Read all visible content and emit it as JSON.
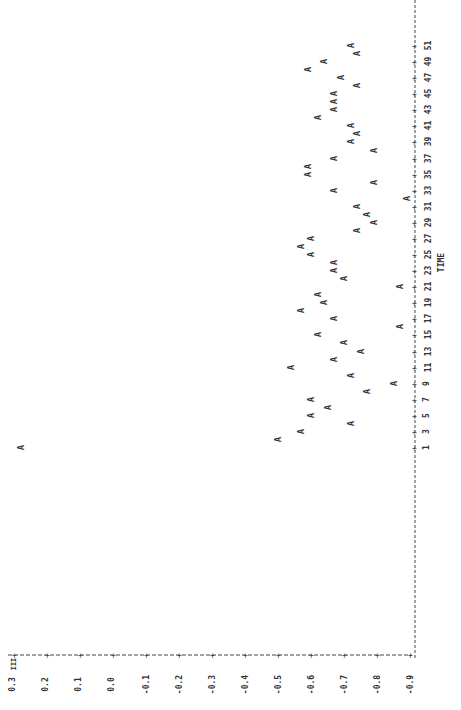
{
  "chart_data": {
    "type": "scatter",
    "title": "",
    "xlabel": "TIME",
    "ylabel": "",
    "orientation_note_visible": "plot rendered rotated: value axis along bottom, TIME axis vertical at right",
    "marker": "A",
    "x_tick_labels": [
      "1",
      "3",
      "5",
      "7",
      "9",
      "11",
      "13",
      "15",
      "17",
      "19",
      "21",
      "23",
      "25",
      "27",
      "29",
      "31",
      "33",
      "35",
      "37",
      "39",
      "41",
      "43",
      "45",
      "47",
      "49",
      "51"
    ],
    "y_tick_labels": [
      "0.3",
      "0.2",
      "0.1",
      "0.0",
      "-0.1",
      "-0.2",
      "-0.3",
      "-0.4",
      "-0.5",
      "-0.6",
      "-0.7",
      "-0.8",
      "-0.9"
    ],
    "ylim": [
      -0.9,
      0.3
    ],
    "xlim": [
      1,
      51
    ],
    "grid": false,
    "legend": null,
    "x": [
      1,
      2,
      3,
      4,
      5,
      6,
      7,
      8,
      9,
      10,
      11,
      12,
      13,
      14,
      15,
      16,
      17,
      18,
      19,
      20,
      21,
      22,
      23,
      24,
      25,
      26,
      27,
      28,
      29,
      30,
      31,
      32,
      33,
      34,
      35,
      36,
      37,
      38,
      39,
      40,
      41,
      42,
      43,
      44,
      45,
      46,
      47,
      48,
      49,
      50,
      51
    ],
    "series": [
      {
        "name": "A",
        "values": [
          0.28,
          -0.5,
          -0.57,
          -0.72,
          -0.6,
          -0.65,
          -0.6,
          -0.77,
          -0.85,
          -0.72,
          -0.54,
          -0.67,
          -0.75,
          -0.7,
          -0.62,
          -0.87,
          -0.67,
          -0.57,
          -0.64,
          -0.62,
          -0.87,
          -0.7,
          -0.67,
          -0.67,
          -0.6,
          -0.57,
          -0.6,
          -0.74,
          -0.79,
          -0.77,
          -0.74,
          -0.89,
          -0.67,
          -0.79,
          -0.59,
          -0.59,
          -0.67,
          -0.79,
          -0.72,
          -0.74,
          -0.72,
          -0.62,
          -0.67,
          -0.67,
          -0.67,
          -0.74,
          -0.69,
          -0.59,
          -0.64,
          -0.74,
          -0.72
        ]
      }
    ],
    "value_axis_label_top": "III"
  },
  "colors": {
    "ink": "#333333",
    "background": "#ffffff"
  }
}
